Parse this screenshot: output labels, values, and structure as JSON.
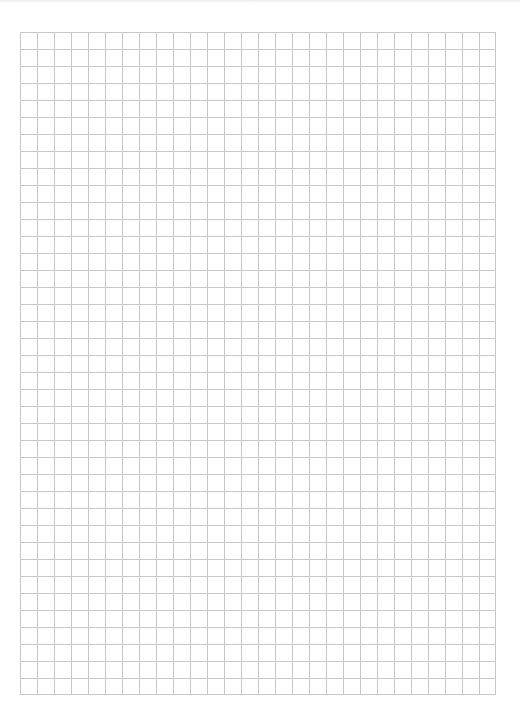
{
  "page": {
    "type": "graph-paper",
    "background_color": "#ffffff",
    "grid": {
      "columns": 28,
      "rows": 39,
      "cell_size_px": 17,
      "line_color": "#c8c8c8"
    }
  }
}
